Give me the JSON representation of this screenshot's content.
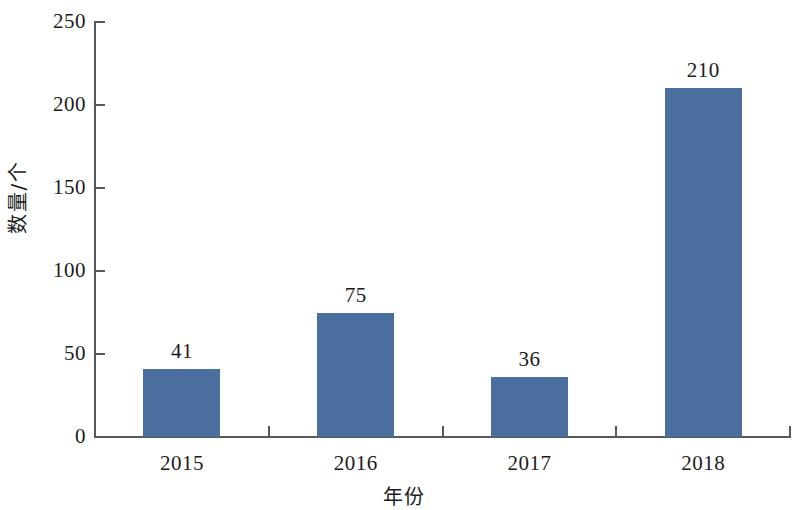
{
  "chart_data": {
    "type": "bar",
    "title": "",
    "subtitle": "",
    "xlabel": "年份",
    "ylabel": "数量/个",
    "categories": [
      "2015",
      "2016",
      "2017",
      "2018"
    ],
    "values": [
      41,
      75,
      36,
      210
    ],
    "data_labels": [
      "41",
      "75",
      "36",
      "210"
    ],
    "ylim": [
      0,
      250
    ],
    "ytick_values": [
      0,
      50,
      100,
      150,
      200,
      250
    ],
    "ytick_labels": [
      "0",
      "50",
      "100",
      "150",
      "200",
      "250"
    ],
    "grid": false,
    "legend": null,
    "legend_position": "none",
    "series": [
      {
        "name": "数量/个",
        "values": [
          41,
          75,
          36,
          210
        ],
        "color": "#4a6e9e"
      }
    ],
    "colors": {
      "bar": "#4a6e9e",
      "axis": "#55595c",
      "text": "#1b1b1b",
      "background": "#ffffff"
    }
  }
}
